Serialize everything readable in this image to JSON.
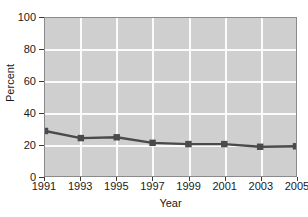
{
  "chart_data": {
    "type": "line",
    "title": "",
    "xlabel": "Year",
    "ylabel": "Percent",
    "categories": [
      "1991",
      "1993",
      "1995",
      "1997",
      "1999",
      "2001",
      "2003",
      "2005"
    ],
    "x": [
      1991,
      1993,
      1995,
      1997,
      1999,
      2001,
      2003,
      2005
    ],
    "values": [
      28.5,
      24.0,
      24.5,
      21.0,
      20.2,
      20.2,
      18.5,
      18.8
    ],
    "series": [
      {
        "name": "Percent",
        "values": [
          28.5,
          24.0,
          24.5,
          21.0,
          20.2,
          20.2,
          18.5,
          18.8
        ]
      }
    ],
    "ylim": [
      0,
      100
    ],
    "yticks": [
      0,
      20,
      40,
      60,
      80,
      100
    ],
    "ytick_labels": [
      "0",
      "20",
      "40",
      "60",
      "80",
      "100"
    ],
    "xlim": [
      1991,
      2005
    ],
    "xticks": [
      1991,
      1993,
      1995,
      1997,
      1999,
      2001,
      2003,
      2005
    ],
    "grid": true,
    "legend": false,
    "legend_position": "none",
    "marker": "square",
    "colors": {
      "plot_background": "#cfcfcf",
      "gridline": "#fbfbfb",
      "line": "#4a4a4a",
      "marker": "#4a4a4a",
      "axis": "#3a3a3a",
      "text": "#1a1a1a",
      "figure_background": "#ffffff"
    }
  }
}
